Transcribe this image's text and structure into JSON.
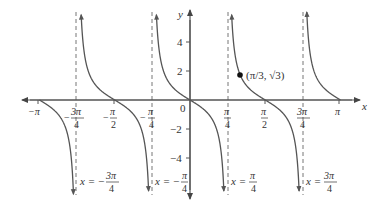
{
  "chart_data": {
    "type": "line",
    "function": "y = -tan(2x)",
    "title": "",
    "xlabel": "x",
    "ylabel": "y",
    "xlim": [
      -3.3416,
      3.3416
    ],
    "ylim": [
      -5.3,
      5.0
    ],
    "grid": false,
    "x_ticks": [
      {
        "value": -3.14159,
        "label": "−π"
      },
      {
        "value": -2.35619,
        "label": "−3π/4"
      },
      {
        "value": -1.5708,
        "label": "−π/2"
      },
      {
        "value": -0.7854,
        "label": "−π/4"
      },
      {
        "value": 0,
        "label": "0"
      },
      {
        "value": 0.7854,
        "label": "π/4"
      },
      {
        "value": 1.5708,
        "label": "π/2"
      },
      {
        "value": 2.35619,
        "label": "3π/4"
      },
      {
        "value": 3.14159,
        "label": "π"
      }
    ],
    "y_ticks": [
      {
        "value": 4,
        "label": "4"
      },
      {
        "value": 2,
        "label": "2"
      },
      {
        "value": -2,
        "label": "−2"
      },
      {
        "value": -4,
        "label": "−4"
      }
    ],
    "asymptotes": [
      {
        "x": -2.35619,
        "label": "x = −3π/4"
      },
      {
        "x": -0.7854,
        "label": "x = −π/4"
      },
      {
        "x": 0.7854,
        "label": "x = π/4"
      },
      {
        "x": 2.35619,
        "label": "x = 3π/4"
      }
    ],
    "annotations": [
      {
        "type": "point",
        "x": 1.0472,
        "y": 1.732,
        "label": "(π/3, √3)"
      }
    ],
    "zeros": [
      -3.14159,
      -1.5708,
      0,
      1.5708,
      3.14159
    ]
  },
  "labels": {
    "x_axis": "x",
    "y_axis": "y",
    "origin": "0",
    "point": "(π/3, √3)",
    "ticks_x": {
      "neg_pi": "−π",
      "neg_3pi4_num": "3π",
      "neg_3pi4_den": "4",
      "neg_pi2_num": "π",
      "neg_pi2_den": "2",
      "neg_pi4_num": "π",
      "neg_pi4_den": "4",
      "pi4_num": "π",
      "pi4_den": "4",
      "pi2_num": "π",
      "pi2_den": "2",
      "threepi4_num": "3π",
      "threepi4_den": "4",
      "pi": "π"
    },
    "ticks_y": {
      "p4": "4",
      "p2": "2",
      "m2": "−2",
      "m4": "−4"
    },
    "asym": {
      "a1_num": "3π",
      "a1_den": "4",
      "a1_prefix": "x = −",
      "a2_num": "π",
      "a2_den": "4",
      "a2_prefix": "x = −",
      "a3_num": "π",
      "a3_den": "4",
      "a3_prefix": "x = ",
      "a4_num": "3π",
      "a4_den": "4",
      "a4_prefix": "x = "
    }
  },
  "colors": {
    "curve": "#555555",
    "axis": "#555555",
    "asymptote": "#777777",
    "text": "#333333"
  }
}
